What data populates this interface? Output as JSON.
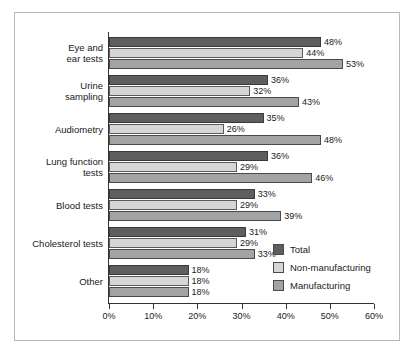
{
  "chart_data": {
    "type": "bar",
    "orientation": "horizontal",
    "title": "",
    "xlabel": "",
    "ylabel": "",
    "xlim": [
      0,
      60
    ],
    "xtick_labels": [
      "0%",
      "10%",
      "20%",
      "30%",
      "40%",
      "50%",
      "60%"
    ],
    "xticks": [
      0,
      10,
      20,
      30,
      40,
      50,
      60
    ],
    "grid": false,
    "legend_position": "inside-right",
    "value_suffix": "%",
    "categories": [
      "Eye and\near tests",
      "Urine\nsampling",
      "Audiometry",
      "Lung function\ntests",
      "Blood tests",
      "Cholesterol tests",
      "Other"
    ],
    "series": [
      {
        "name": "Total",
        "color": "#5e5e5e",
        "values": [
          48,
          36,
          35,
          36,
          33,
          31,
          18
        ],
        "labels": [
          "48%",
          "36%",
          "35%",
          "36%",
          "33%",
          "31%",
          "18%"
        ]
      },
      {
        "name": "Non-manufacturing",
        "color": "#d6d6d6",
        "values": [
          44,
          32,
          26,
          29,
          29,
          29,
          18
        ],
        "labels": [
          "44%",
          "32%",
          "26%",
          "29%",
          "29%",
          "29%",
          "18%"
        ]
      },
      {
        "name": "Manufacturing",
        "color": "#a3a3a3",
        "values": [
          53,
          43,
          48,
          46,
          39,
          33,
          18
        ],
        "labels": [
          "53%",
          "43%",
          "48%",
          "46%",
          "39%",
          "33%",
          "18%"
        ]
      }
    ]
  }
}
